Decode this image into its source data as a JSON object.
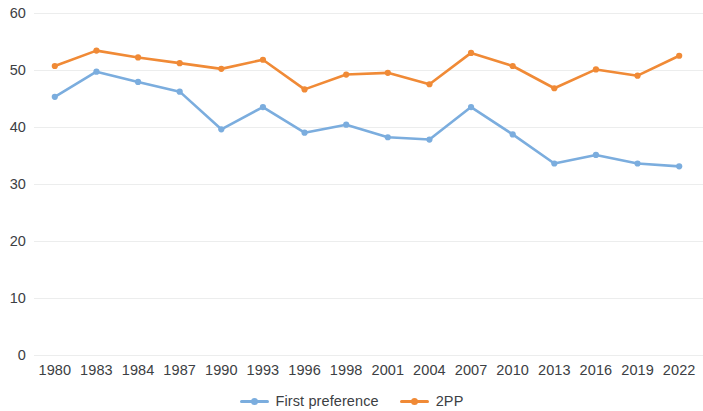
{
  "chart_data": {
    "type": "line",
    "title": "",
    "subtitle": "",
    "xlabel": "",
    "ylabel": "",
    "categories": [
      "1980",
      "1983",
      "1984",
      "1987",
      "1990",
      "1993",
      "1996",
      "1998",
      "2001",
      "2004",
      "2007",
      "2010",
      "2013",
      "2016",
      "2019",
      "2022"
    ],
    "series": [
      {
        "name": "First preference",
        "color": "#7badde",
        "values": [
          45.3,
          49.7,
          47.9,
          46.2,
          39.6,
          43.5,
          39.0,
          40.4,
          38.2,
          37.8,
          43.5,
          38.7,
          33.6,
          35.1,
          33.6,
          33.1
        ]
      },
      {
        "name": "2PP",
        "color": "#f08a36",
        "values": [
          50.7,
          53.4,
          52.2,
          51.2,
          50.2,
          51.8,
          46.6,
          49.2,
          49.5,
          47.5,
          53.0,
          50.7,
          46.8,
          50.1,
          49.0,
          52.5
        ]
      }
    ],
    "ylim": [
      0,
      60
    ],
    "yticks": [
      0,
      10,
      20,
      30,
      40,
      50,
      60
    ],
    "ytick_labels": [
      "0",
      "10",
      "20",
      "30",
      "40",
      "50",
      "60"
    ],
    "grid": true,
    "grid_color": "#eceded",
    "legend_position": "bottom",
    "background": "#ffffff",
    "text_color": "#3c4043",
    "markers": true
  }
}
